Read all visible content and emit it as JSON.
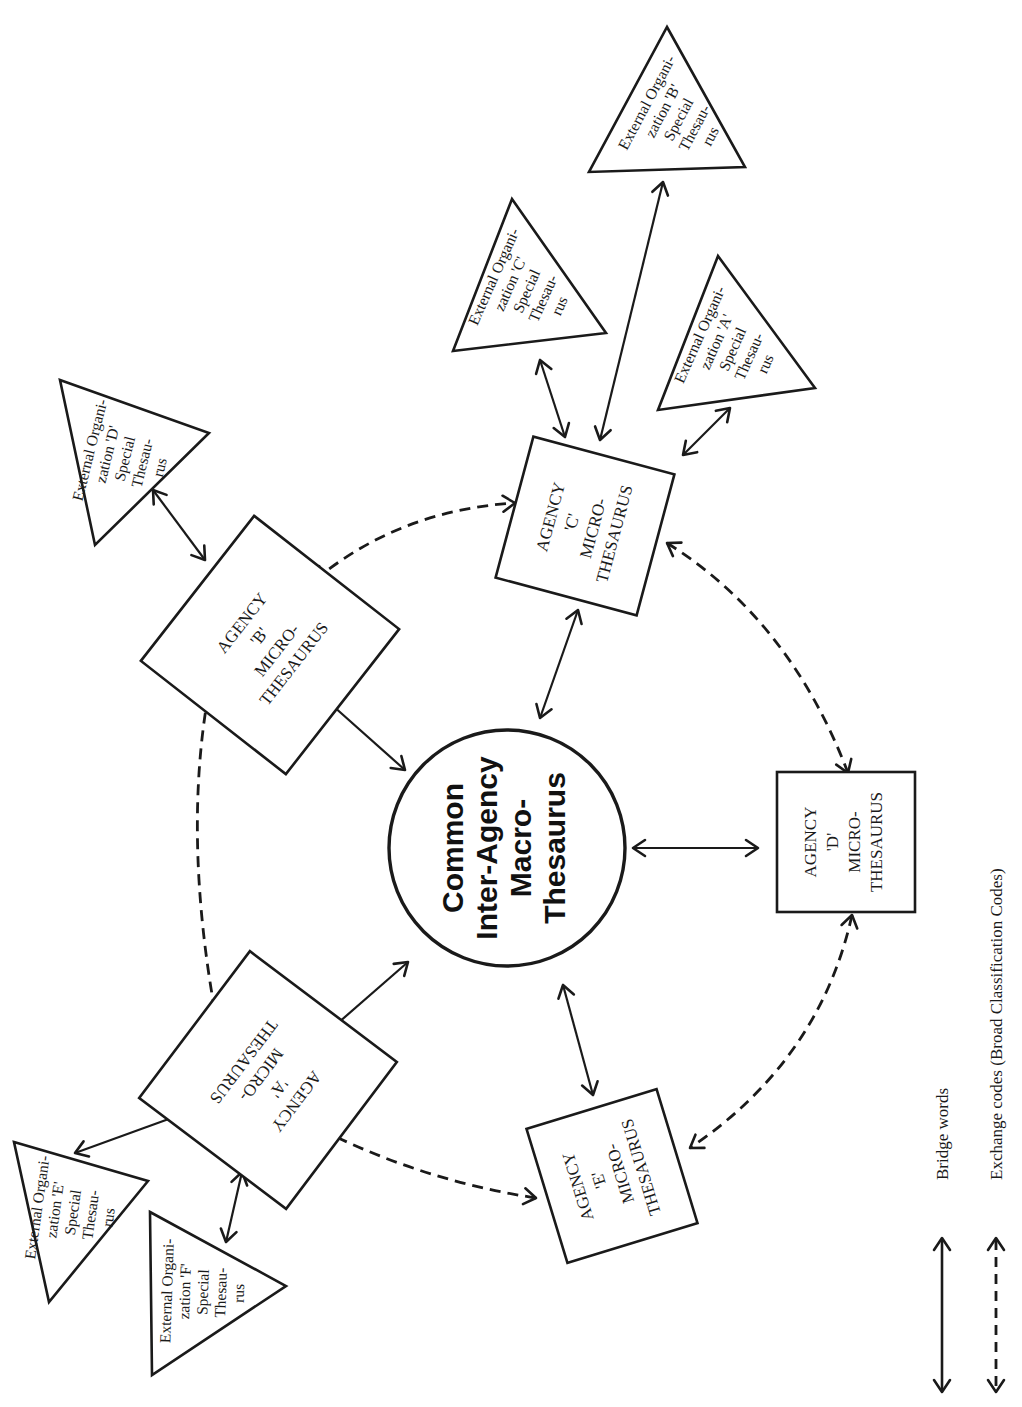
{
  "hub": {
    "lines": [
      "Common",
      "Inter-Agency",
      "Macro-",
      "Thesaurus"
    ]
  },
  "agencies": [
    {
      "id": "A",
      "lines": [
        "AGENCY",
        "'A'",
        "MICRO-",
        "THESAURUS"
      ]
    },
    {
      "id": "B",
      "lines": [
        "AGENCY",
        "'B'",
        "MICRO-",
        "THESAURUS"
      ]
    },
    {
      "id": "C",
      "lines": [
        "AGENCY",
        "'C'",
        "MICRO-",
        "THESAURUS"
      ]
    },
    {
      "id": "D",
      "lines": [
        "AGENCY",
        "'D'",
        "MICRO-",
        "THESAURUS"
      ]
    },
    {
      "id": "E",
      "lines": [
        "AGENCY",
        "'E'",
        "MICRO-",
        "THESAURUS"
      ]
    }
  ],
  "externals": [
    {
      "id": "A",
      "lines": [
        "External Organi-",
        "zation  'A'",
        "Special",
        "Thesau-",
        "rus"
      ]
    },
    {
      "id": "B",
      "lines": [
        "External Organi-",
        "zation  'B'",
        "Special",
        "Thesau-",
        "rus"
      ]
    },
    {
      "id": "C",
      "lines": [
        "External Organi-",
        "zation  'C'",
        "Special",
        "Thesau-",
        "rus"
      ]
    },
    {
      "id": "D",
      "lines": [
        "External Organi-",
        "zation  'D'",
        "Special",
        "Thesau-",
        "rus"
      ]
    },
    {
      "id": "E",
      "lines": [
        "External Organi-",
        "zation  'E'",
        "Special",
        "Thesau-",
        "rus"
      ]
    },
    {
      "id": "F",
      "lines": [
        "External Organi-",
        "zation  'F'",
        "Special",
        "Thesau-",
        "rus"
      ]
    }
  ],
  "connections": {
    "bridge": [
      [
        "hub",
        "agency-A"
      ],
      [
        "hub",
        "agency-B"
      ],
      [
        "hub",
        "agency-C"
      ],
      [
        "hub",
        "agency-D"
      ],
      [
        "hub",
        "agency-E"
      ],
      [
        "agency-C",
        "external-A"
      ],
      [
        "agency-C",
        "external-B"
      ],
      [
        "agency-C",
        "external-C"
      ],
      [
        "agency-B",
        "external-D"
      ],
      [
        "agency-A",
        "external-E"
      ],
      [
        "agency-A",
        "external-F"
      ]
    ],
    "exchange": [
      [
        "agency-B",
        "agency-C"
      ],
      [
        "agency-C",
        "agency-D"
      ],
      [
        "agency-D",
        "agency-E"
      ],
      [
        "agency-E",
        "agency-A"
      ],
      [
        "agency-A",
        "agency-B"
      ]
    ]
  },
  "legend": {
    "bridge_label": "Bridge words",
    "exchange_label": "Exchange codes (Broad Classification Codes)"
  }
}
